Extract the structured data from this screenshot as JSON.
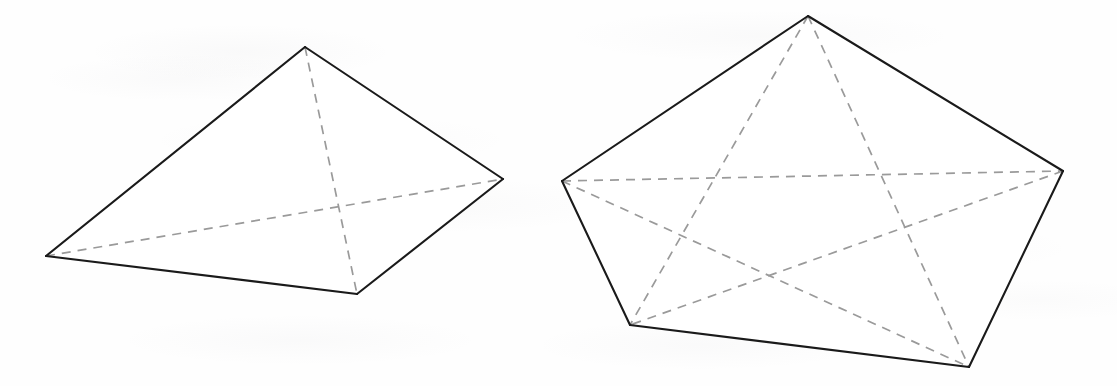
{
  "page": {
    "width": 1117,
    "height": 386,
    "background_color": "#fefefe",
    "medium": "scanned textbook page with faint reverse-side show-through"
  },
  "style": {
    "solid_edge_color": "#1a1a1a",
    "solid_edge_width": 2.1,
    "hidden_edge_color": "#9a9a9a",
    "hidden_edge_width": 1.7,
    "hidden_edge_dash": "9 7",
    "face_fill_color": "#ffffff"
  },
  "figures": [
    {
      "id": "square-pyramid",
      "name": "Square pyramid",
      "base_sides": 4,
      "vertex_count": 5,
      "edge_count": 8,
      "vertices": {
        "apex": {
          "x": 305,
          "y": 47
        },
        "base_left": {
          "x": 46,
          "y": 256
        },
        "base_right": {
          "x": 503,
          "y": 179
        },
        "base_front": {
          "x": 357,
          "y": 294
        },
        "base_back": {
          "x": 305,
          "y": 47
        }
      },
      "outline_points": "46,256 305,47 503,179 357,294",
      "solid_edges": [
        {
          "name": "left-to-apex",
          "from": "base_left",
          "to": "apex",
          "points": "46,256 305,47"
        },
        {
          "name": "apex-to-right",
          "from": "apex",
          "to": "base_right",
          "points": "305,47 503,179"
        },
        {
          "name": "right-to-front",
          "from": "base_right",
          "to": "base_front",
          "points": "503,179 357,294"
        },
        {
          "name": "front-to-left",
          "from": "base_front",
          "to": "base_left",
          "points": "357,294 46,256"
        }
      ],
      "hidden_edges": [
        {
          "name": "base-diagonal-horizontal",
          "from": "base_left",
          "to": "base_right",
          "points": "46,256 503,179"
        },
        {
          "name": "base-diagonal-vertical",
          "from": "apex",
          "to": "base_front",
          "points": "305,47 357,294"
        }
      ]
    },
    {
      "id": "pentagonal-pyramid",
      "name": "Pentagonal pyramid",
      "base_sides": 5,
      "vertex_count": 6,
      "edge_count": 10,
      "vertices": {
        "apex": {
          "x": 808,
          "y": 16
        },
        "base_left": {
          "x": 562,
          "y": 181
        },
        "base_right": {
          "x": 1063,
          "y": 171
        },
        "base_bottom_left": {
          "x": 630,
          "y": 325
        },
        "base_bottom_right": {
          "x": 969,
          "y": 367
        }
      },
      "outline_points": "562,181 808,16 1063,171 969,367 630,325",
      "solid_edges": [
        {
          "name": "left-to-apex",
          "from": "base_left",
          "to": "apex",
          "points": "562,181 808,16"
        },
        {
          "name": "apex-to-right",
          "from": "apex",
          "to": "base_right",
          "points": "808,16 1063,171"
        },
        {
          "name": "right-to-bottom-right",
          "from": "base_right",
          "to": "base_bottom_right",
          "points": "1063,171 969,367"
        },
        {
          "name": "bottom-right-to-bottom-left",
          "from": "base_bottom_right",
          "to": "base_bottom_left",
          "points": "969,367 630,325"
        },
        {
          "name": "bottom-left-to-left",
          "from": "base_bottom_left",
          "to": "base_left",
          "points": "630,325 562,181"
        }
      ],
      "hidden_edges": [
        {
          "name": "base-chord-left-to-right",
          "from": "base_left",
          "to": "base_right",
          "points": "562,181 1063,171"
        },
        {
          "name": "base-chord-left-to-bottom-right",
          "from": "base_left",
          "to": "base_bottom_right",
          "points": "562,181 969,367"
        },
        {
          "name": "base-chord-right-to-bottom-left",
          "from": "base_right",
          "to": "base_bottom_left",
          "points": "1063,171 630,325"
        },
        {
          "name": "apex-to-bottom-left",
          "from": "apex",
          "to": "base_bottom_left",
          "points": "808,16 630,325"
        },
        {
          "name": "apex-to-bottom-right",
          "from": "apex",
          "to": "base_bottom_right",
          "points": "808,16 969,367"
        }
      ]
    }
  ]
}
